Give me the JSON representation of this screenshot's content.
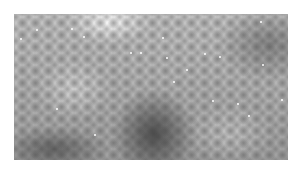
{
  "image": {
    "description": "Grayscale micrograph-like texture of a cellular/dotted surface with white speckles, framed by a white border",
    "colors": {
      "background": "#ffffff",
      "mid_gray": "#b8b8b8",
      "dark_region": "#3a3a3a",
      "speckle": "#ffffff"
    },
    "speckles": [
      [
        36,
        29
      ],
      [
        83,
        36
      ],
      [
        130,
        52
      ],
      [
        166,
        57
      ],
      [
        219,
        56
      ],
      [
        260,
        21
      ],
      [
        262,
        64
      ],
      [
        20,
        38
      ],
      [
        71,
        28
      ],
      [
        162,
        37
      ],
      [
        186,
        69
      ],
      [
        204,
        53
      ],
      [
        140,
        52
      ],
      [
        237,
        103
      ],
      [
        248,
        115
      ],
      [
        94,
        134
      ],
      [
        212,
        100
      ],
      [
        56,
        108
      ],
      [
        173,
        81
      ],
      [
        281,
        99
      ]
    ]
  }
}
